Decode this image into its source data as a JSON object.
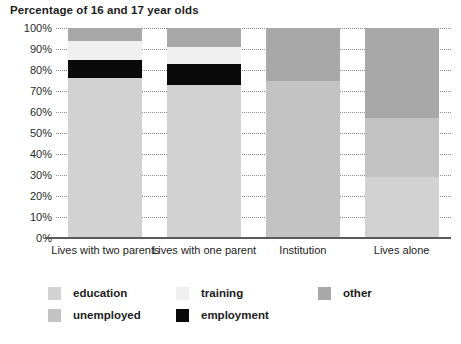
{
  "chart_data": {
    "type": "bar",
    "subtype": "stacked-bar-100",
    "title": "Percentage of 16 and 17 year olds",
    "xlabel": "",
    "ylabel": "",
    "ylim": [
      0,
      100
    ],
    "yticks": [
      "0%",
      "10%",
      "20%",
      "30%",
      "40%",
      "50%",
      "60%",
      "70%",
      "80%",
      "90%",
      "100%"
    ],
    "grid": true,
    "legend_position": "bottom",
    "categories": [
      "Lives with two parents",
      "Lives with one parent",
      "Institution",
      "Lives alone"
    ],
    "series": [
      {
        "name": "education",
        "color": "#d2d2d2",
        "values": [
          76,
          73,
          0,
          29
        ]
      },
      {
        "name": "employment",
        "color": "#0a0a0a",
        "values": [
          9,
          10,
          0,
          0
        ]
      },
      {
        "name": "training",
        "color": "#f0f0f0",
        "values": [
          9,
          8,
          0,
          0
        ]
      },
      {
        "name": "unemployed",
        "color": "#c3c3c3",
        "values": [
          0,
          0,
          75,
          28
        ]
      },
      {
        "name": "other",
        "color": "#a8a8a8",
        "values": [
          6,
          9,
          25,
          43
        ]
      }
    ],
    "stack_order_bottom_to_top": [
      "education",
      "employment",
      "training",
      "unemployed",
      "other"
    ]
  },
  "legend": {
    "rows": [
      [
        {
          "label": "education",
          "color": "#d2d2d2"
        },
        {
          "label": "training",
          "color": "#f0f0f0"
        },
        {
          "label": "other",
          "color": "#a8a8a8"
        }
      ],
      [
        {
          "label": "unemployed",
          "color": "#c3c3c3"
        },
        {
          "label": "employment",
          "color": "#0a0a0a"
        }
      ]
    ]
  }
}
